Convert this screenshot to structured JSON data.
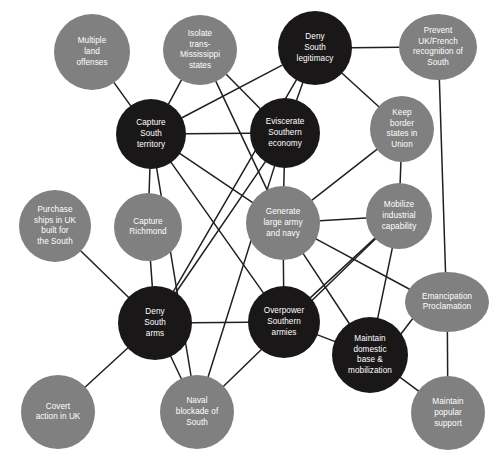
{
  "diagram": {
    "type": "node-link-network",
    "canvas": {
      "width": 501,
      "height": 465
    },
    "colors": {
      "dark_node": "#1a1718",
      "light_node": "#808080",
      "edge": "#231f20",
      "label_text": "#ffffff",
      "background": "#ffffff"
    },
    "legend": {
      "dark_meaning": "dark-filled node",
      "light_meaning": "gray-filled node"
    },
    "nodes": [
      {
        "id": "multiple-land-offenses",
        "label": "Multiple land offenses",
        "lines": [
          "Multiple",
          "land",
          "offenses"
        ],
        "cx": 92,
        "cy": 52,
        "rx": 38,
        "ry": 38,
        "fill": "light"
      },
      {
        "id": "isolate-trans-mississippi-states",
        "label": "Isolate trans-Mississippi states",
        "lines": [
          "Isolate",
          "trans-",
          "Mississippi",
          "states"
        ],
        "cx": 200,
        "cy": 50,
        "rx": 37,
        "ry": 35,
        "fill": "light"
      },
      {
        "id": "deny-south-legitimacy",
        "label": "Deny South legitimacy",
        "lines": [
          "Deny",
          "South",
          "legitimacy"
        ],
        "cx": 315,
        "cy": 48,
        "rx": 37,
        "ry": 37,
        "fill": "dark"
      },
      {
        "id": "prevent-uk-french-recognition-of-south",
        "label": "Prevent UK/French recognition of South",
        "lines": [
          "Prevent",
          "UK/French",
          "recognition of",
          "South"
        ],
        "cx": 438,
        "cy": 47,
        "rx": 39,
        "ry": 33,
        "fill": "light"
      },
      {
        "id": "capture-south-territory",
        "label": "Capture South territory",
        "lines": [
          "Capture",
          "South",
          "territory"
        ],
        "cx": 151,
        "cy": 134,
        "rx": 35,
        "ry": 35,
        "fill": "dark"
      },
      {
        "id": "eviscerate-southern-economy",
        "label": "Eviscerate Southern economy",
        "lines": [
          "Eviscerate",
          "Southern",
          "economy"
        ],
        "cx": 285,
        "cy": 133,
        "rx": 35,
        "ry": 35,
        "fill": "dark"
      },
      {
        "id": "keep-border-states-in-union",
        "label": "Keep border states in Union",
        "lines": [
          "Keep",
          "border",
          "states in",
          "Union"
        ],
        "cx": 402,
        "cy": 129,
        "rx": 32,
        "ry": 33,
        "fill": "light"
      },
      {
        "id": "purchase-ships-in-uk-built-for-the-south",
        "label": "Purchase ships in UK built for the South",
        "lines": [
          "Purchase",
          "ships in UK",
          "built for",
          "the South"
        ],
        "cx": 55,
        "cy": 226,
        "rx": 36,
        "ry": 36,
        "fill": "light"
      },
      {
        "id": "capture-richmond",
        "label": "Capture Richmond",
        "lines": [
          "Capture",
          "Richmond"
        ],
        "cx": 148,
        "cy": 227,
        "rx": 34,
        "ry": 34,
        "fill": "light"
      },
      {
        "id": "generate-large-army-and-navy",
        "label": "Generate large army and navy",
        "lines": [
          "Generate",
          "large army",
          "and navy"
        ],
        "cx": 283,
        "cy": 223,
        "rx": 37,
        "ry": 37,
        "fill": "light"
      },
      {
        "id": "mobilize-industrial-capability",
        "label": "Mobilize industrial capability",
        "lines": [
          "Mobilize",
          "industrial",
          "capability"
        ],
        "cx": 399,
        "cy": 216,
        "rx": 33,
        "ry": 33,
        "fill": "light"
      },
      {
        "id": "emancipation-proclamation",
        "label": "Emancipation Proclamation",
        "lines": [
          "Emancipation",
          "Proclamation"
        ],
        "cx": 447,
        "cy": 302,
        "rx": 42,
        "ry": 30,
        "fill": "light"
      },
      {
        "id": "deny-south-arms",
        "label": "Deny South arms",
        "lines": [
          "Deny",
          "South",
          "arms"
        ],
        "cx": 155,
        "cy": 323,
        "rx": 37,
        "ry": 37,
        "fill": "dark"
      },
      {
        "id": "overpower-southern-armies",
        "label": "Overpower Southern armies",
        "lines": [
          "Overpower",
          "Southern",
          "armies"
        ],
        "cx": 284,
        "cy": 322,
        "rx": 36,
        "ry": 36,
        "fill": "dark"
      },
      {
        "id": "maintain-domestic-base-mobilization",
        "label": "Maintain domestic base & mobilization",
        "lines": [
          "Maintain",
          "domestic",
          "base &",
          "mobilization"
        ],
        "cx": 370,
        "cy": 355,
        "rx": 38,
        "ry": 38,
        "fill": "dark"
      },
      {
        "id": "covert-action-in-uk",
        "label": "Covert action in UK",
        "lines": [
          "Covert",
          "action in UK"
        ],
        "cx": 58,
        "cy": 412,
        "rx": 37,
        "ry": 37,
        "fill": "light"
      },
      {
        "id": "naval-blockade-of-south",
        "label": "Naval blockade of South",
        "lines": [
          "Naval",
          "blockade of",
          "South"
        ],
        "cx": 197,
        "cy": 412,
        "rx": 37,
        "ry": 37,
        "fill": "light"
      },
      {
        "id": "maintain-popular-support",
        "label": "Maintain popular support",
        "lines": [
          "Maintain",
          "popular",
          "support"
        ],
        "cx": 448,
        "cy": 413,
        "rx": 37,
        "ry": 37,
        "fill": "light"
      }
    ],
    "edges": [
      {
        "from": "multiple-land-offenses",
        "to": "capture-south-territory"
      },
      {
        "from": "isolate-trans-mississippi-states",
        "to": "capture-south-territory"
      },
      {
        "from": "isolate-trans-mississippi-states",
        "to": "eviscerate-southern-economy"
      },
      {
        "from": "isolate-trans-mississippi-states",
        "to": "generate-large-army-and-navy"
      },
      {
        "from": "deny-south-legitimacy",
        "to": "prevent-uk-french-recognition-of-south"
      },
      {
        "from": "deny-south-legitimacy",
        "to": "capture-south-territory"
      },
      {
        "from": "deny-south-legitimacy",
        "to": "eviscerate-southern-economy"
      },
      {
        "from": "deny-south-legitimacy",
        "to": "keep-border-states-in-union"
      },
      {
        "from": "deny-south-legitimacy",
        "to": "deny-south-arms"
      },
      {
        "from": "prevent-uk-french-recognition-of-south",
        "to": "emancipation-proclamation"
      },
      {
        "from": "capture-south-territory",
        "to": "eviscerate-southern-economy"
      },
      {
        "from": "capture-south-territory",
        "to": "capture-richmond"
      },
      {
        "from": "capture-south-territory",
        "to": "generate-large-army-and-navy"
      },
      {
        "from": "capture-south-territory",
        "to": "overpower-southern-armies"
      },
      {
        "from": "capture-south-territory",
        "to": "naval-blockade-of-south"
      },
      {
        "from": "eviscerate-southern-economy",
        "to": "generate-large-army-and-navy"
      },
      {
        "from": "eviscerate-southern-economy",
        "to": "deny-south-arms"
      },
      {
        "from": "eviscerate-southern-economy",
        "to": "naval-blockade-of-south"
      },
      {
        "from": "keep-border-states-in-union",
        "to": "mobilize-industrial-capability"
      },
      {
        "from": "keep-border-states-in-union",
        "to": "generate-large-army-and-navy"
      },
      {
        "from": "purchase-ships-in-uk-built-for-the-south",
        "to": "deny-south-arms"
      },
      {
        "from": "capture-richmond",
        "to": "deny-south-arms"
      },
      {
        "from": "generate-large-army-and-navy",
        "to": "mobilize-industrial-capability"
      },
      {
        "from": "generate-large-army-and-navy",
        "to": "overpower-southern-armies"
      },
      {
        "from": "generate-large-army-and-navy",
        "to": "maintain-domestic-base-mobilization"
      },
      {
        "from": "generate-large-army-and-navy",
        "to": "emancipation-proclamation"
      },
      {
        "from": "mobilize-industrial-capability",
        "to": "overpower-southern-armies"
      },
      {
        "from": "mobilize-industrial-capability",
        "to": "maintain-domestic-base-mobilization"
      },
      {
        "from": "emancipation-proclamation",
        "to": "maintain-domestic-base-mobilization"
      },
      {
        "from": "emancipation-proclamation",
        "to": "maintain-popular-support"
      },
      {
        "from": "deny-south-arms",
        "to": "covert-action-in-uk"
      },
      {
        "from": "deny-south-arms",
        "to": "naval-blockade-of-south"
      },
      {
        "from": "deny-south-arms",
        "to": "overpower-southern-armies"
      },
      {
        "from": "overpower-southern-armies",
        "to": "maintain-domestic-base-mobilization"
      },
      {
        "from": "maintain-domestic-base-mobilization",
        "to": "maintain-popular-support"
      },
      {
        "from": "naval-blockade-of-south",
        "to": "mobilize-industrial-capability"
      }
    ]
  }
}
